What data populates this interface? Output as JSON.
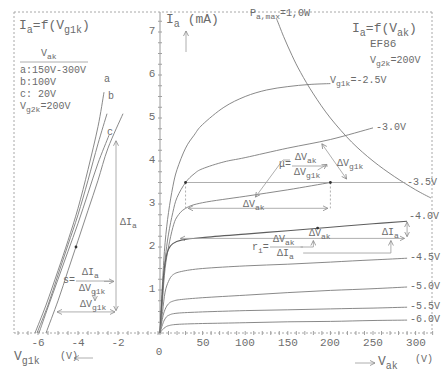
{
  "left_panel": {
    "title": {
      "i": "I",
      "i_sub": "a",
      "mid": "=f(V",
      "v_sub": "g1k",
      "end": ")"
    },
    "legend": {
      "header": {
        "main": "V",
        "sub": "ak"
      },
      "items": [
        "a:150V-300V",
        "b:100V",
        "c: 20V"
      ],
      "vg2k": {
        "main": "V",
        "sub": "g2k",
        "value": "=200V"
      }
    },
    "curve_labels": {
      "a": "a",
      "b": "b",
      "c": "c"
    },
    "delta_ia": {
      "main": "ΔI",
      "sub": "a"
    },
    "slope_formula": {
      "lhs": "s=",
      "num_main": "ΔI",
      "num_sub": "a",
      "den_main": "ΔV",
      "den_sub": "g1k"
    },
    "delta_vg1k": {
      "main": "ΔV",
      "sub": "g1k"
    },
    "x_ticks": [
      "-6",
      "-4",
      "-2"
    ],
    "x_axis_label": {
      "main": "V",
      "sub": "g1k",
      "unit": "(V)",
      "arrow": "←—"
    }
  },
  "main_panel": {
    "y_ticks": [
      "1",
      "2",
      "3",
      "4",
      "5",
      "6",
      "7"
    ],
    "y_axis_label": {
      "main": "I",
      "sub": "a",
      "unit": "(mA)",
      "arrow": "↑"
    },
    "power_label": {
      "main": "P",
      "sub": "a,max",
      "value": "=1,0W"
    },
    "title": {
      "i": "I",
      "i_sub": "a",
      "mid": "=f(V",
      "v_sub": "ak",
      "end": ")"
    },
    "tube": "EF86",
    "vg2k": {
      "main": "V",
      "sub": "g2k",
      "value": "=200V"
    },
    "curve_labels": {
      "first": {
        "main": "V",
        "sub": "g1k",
        "value": "=-2.5V"
      },
      "others": [
        "-3.0V",
        "-3.5V",
        "-4.0V",
        "-4.5V",
        "-5.0V",
        "-5.5V",
        "-6.0V"
      ]
    },
    "mu_formula": {
      "lhs": "μ=",
      "num_main": "ΔV",
      "num_sub": "ak",
      "den_main": "ΔV",
      "den_sub": "g1k"
    },
    "delta_vg1k": {
      "main": "ΔV",
      "sub": "g1k"
    },
    "delta_vak_mu": {
      "main": "ΔV",
      "sub": "ak"
    },
    "delta_vak_ri": {
      "main": "ΔV",
      "sub": "ak"
    },
    "delta_ia_ri": {
      "main": "ΔI",
      "sub": "a"
    },
    "ri_formula": {
      "lhs_main": "r",
      "lhs_sub": "i",
      "eq": "=",
      "num_main": "ΔV",
      "num_sub": "ak",
      "den_main": "ΔI",
      "den_sub": "a"
    },
    "x_ticks": [
      "50",
      "100",
      "150",
      "200",
      "250",
      "300"
    ],
    "origin": "0",
    "x_axis_label": {
      "arrow": "—→",
      "main": "V",
      "sub": "ak",
      "unit": "(V)"
    }
  },
  "colors": {
    "line": "#7c7c7c",
    "annotation": "#9a9a9a",
    "text": "#6b6b6b",
    "background": "#ffffff"
  },
  "chart_data": [
    {
      "type": "line",
      "title": "Ia=f(Vak)",
      "subtitle": "EF86, Vg2k=200V",
      "xlabel": "Vak (V)",
      "ylabel": "Ia (mA)",
      "xlim": [
        0,
        320
      ],
      "ylim": [
        0,
        7.5
      ],
      "xticks": [
        0,
        50,
        100,
        150,
        200,
        250,
        300
      ],
      "yticks": [
        1,
        2,
        3,
        4,
        5,
        6,
        7
      ],
      "grid": false,
      "legend": "inline labels at curve ends",
      "series": [
        {
          "name": "Vg1k=-2.5V",
          "points": [
            [
              0,
              0
            ],
            [
              3,
              1.2
            ],
            [
              6,
              2.1
            ],
            [
              10,
              2.8
            ],
            [
              15,
              3.4
            ],
            [
              20,
              3.8
            ],
            [
              30,
              4.3
            ],
            [
              40,
              4.6
            ],
            [
              50,
              4.85
            ],
            [
              75,
              5.25
            ],
            [
              100,
              5.5
            ],
            [
              125,
              5.65
            ],
            [
              150,
              5.73
            ],
            [
              175,
              5.78
            ],
            [
              200,
              5.8
            ]
          ]
        },
        {
          "name": "-3.0V",
          "points": [
            [
              0,
              0
            ],
            [
              3,
              0.9
            ],
            [
              6,
              1.7
            ],
            [
              10,
              2.3
            ],
            [
              15,
              2.8
            ],
            [
              20,
              3.15
            ],
            [
              30,
              3.5
            ],
            [
              40,
              3.7
            ],
            [
              50,
              3.82
            ],
            [
              75,
              3.98
            ],
            [
              100,
              4.08
            ],
            [
              150,
              4.3
            ],
            [
              200,
              4.5
            ],
            [
              250,
              4.77
            ]
          ]
        },
        {
          "name": "-3.5V",
          "points": [
            [
              0,
              0
            ],
            [
              3,
              0.8
            ],
            [
              6,
              1.5
            ],
            [
              10,
              2.0
            ],
            [
              15,
              2.45
            ],
            [
              20,
              2.7
            ],
            [
              30,
              2.9
            ],
            [
              50,
              3.03
            ],
            [
              100,
              3.18
            ],
            [
              150,
              3.33
            ],
            [
              200,
              3.5
            ]
          ]
        },
        {
          "name": "-4.0V",
          "points": [
            [
              0,
              0
            ],
            [
              2,
              0.7
            ],
            [
              4,
              1.3
            ],
            [
              7,
              1.75
            ],
            [
              10,
              1.95
            ],
            [
              15,
              2.08
            ],
            [
              25,
              2.16
            ],
            [
              50,
              2.22
            ],
            [
              100,
              2.3
            ],
            [
              150,
              2.38
            ],
            [
              200,
              2.46
            ],
            [
              250,
              2.54
            ],
            [
              290,
              2.6
            ]
          ]
        },
        {
          "name": "-4.5V",
          "points": [
            [
              0,
              0
            ],
            [
              3,
              0.5
            ],
            [
              6,
              0.95
            ],
            [
              10,
              1.2
            ],
            [
              15,
              1.35
            ],
            [
              25,
              1.43
            ],
            [
              50,
              1.5
            ],
            [
              100,
              1.56
            ],
            [
              150,
              1.6
            ],
            [
              200,
              1.65
            ],
            [
              250,
              1.7
            ],
            [
              290,
              1.74
            ]
          ]
        },
        {
          "name": "-5.0V",
          "points": [
            [
              0,
              0
            ],
            [
              3,
              0.35
            ],
            [
              6,
              0.55
            ],
            [
              10,
              0.68
            ],
            [
              15,
              0.74
            ],
            [
              25,
              0.78
            ],
            [
              50,
              0.82
            ],
            [
              100,
              0.88
            ],
            [
              150,
              0.94
            ],
            [
              200,
              0.99
            ],
            [
              250,
              1.03
            ],
            [
              290,
              1.07
            ]
          ]
        },
        {
          "name": "-5.5V",
          "points": [
            [
              0,
              0
            ],
            [
              3,
              0.2
            ],
            [
              6,
              0.33
            ],
            [
              10,
              0.41
            ],
            [
              20,
              0.46
            ],
            [
              50,
              0.49
            ],
            [
              100,
              0.52
            ],
            [
              150,
              0.54
            ],
            [
              200,
              0.56
            ],
            [
              250,
              0.58
            ],
            [
              290,
              0.6
            ]
          ]
        },
        {
          "name": "-6.0V",
          "points": [
            [
              0,
              0
            ],
            [
              3,
              0.08
            ],
            [
              6,
              0.13
            ],
            [
              10,
              0.17
            ],
            [
              20,
              0.2
            ],
            [
              50,
              0.22
            ],
            [
              100,
              0.24
            ],
            [
              150,
              0.26
            ],
            [
              200,
              0.27
            ],
            [
              250,
              0.29
            ],
            [
              290,
              0.3
            ]
          ]
        }
      ],
      "power_limit": {
        "name": "Pa,max=1,0W",
        "points": [
          [
            137,
            7.3
          ],
          [
            145,
            6.9
          ],
          [
            155,
            6.45
          ],
          [
            165,
            6.06
          ],
          [
            180,
            5.56
          ],
          [
            200,
            5.0
          ],
          [
            225,
            4.44
          ],
          [
            250,
            4.0
          ],
          [
            275,
            3.64
          ],
          [
            300,
            3.33
          ],
          [
            318,
            3.14
          ]
        ]
      },
      "annotations": [
        {
          "kind": "line",
          "from": [
            30,
            3.5
          ],
          "to": [
            288,
            3.5
          ]
        },
        {
          "kind": "dashed",
          "from": [
            30,
            3.5
          ],
          "to": [
            30,
            2.9
          ]
        },
        {
          "kind": "dashed",
          "from": [
            200,
            3.5
          ],
          "to": [
            200,
            2.9
          ]
        },
        {
          "kind": "darrow",
          "from": [
            33,
            2.9
          ],
          "to": [
            197,
            2.9
          ]
        },
        {
          "kind": "darrow",
          "from": [
            190,
            4.4
          ],
          "to": [
            219,
            3.58
          ]
        },
        {
          "kind": "arrow",
          "from": [
            144,
            4.02
          ],
          "to": [
            112,
            3.16
          ]
        },
        {
          "kind": "arrow",
          "from": [
            185,
            3.79
          ],
          "to": [
            196,
            3.92
          ]
        },
        {
          "kind": "darrow",
          "from": [
            24,
            2.2
          ],
          "to": [
            287,
            2.2
          ]
        },
        {
          "kind": "darrow",
          "from": [
            290,
            2.58
          ],
          "to": [
            290,
            2.24
          ]
        },
        {
          "kind": "polyarrow",
          "points": [
            [
              165,
              2.0
            ],
            [
              180,
              2.0
            ],
            [
              180,
              2.15
            ]
          ]
        },
        {
          "kind": "polyarrow",
          "points": [
            [
              168,
              1.86
            ],
            [
              271,
              1.86
            ],
            [
              271,
              2.15
            ]
          ]
        },
        {
          "kind": "dot",
          "at": [
            30,
            3.5
          ]
        },
        {
          "kind": "dot",
          "at": [
            200,
            3.5
          ]
        },
        {
          "kind": "dot",
          "at": [
            185,
            2.44
          ]
        }
      ]
    },
    {
      "type": "line",
      "title": "Ia=f(Vg1k)",
      "subtitle": "Vg2k=200V; a:150V-300V, b:100V, c:20V",
      "xlabel": "Vg1k (V)",
      "ylabel": "Ia (mA)",
      "xlim": [
        -7,
        0
      ],
      "ylim": [
        0,
        7.5
      ],
      "xticks": [
        -6,
        -4,
        -2
      ],
      "grid": false,
      "series": [
        {
          "name": "a (300V)",
          "points": [
            [
              -6.15,
              0
            ],
            [
              -5.6,
              0.65
            ],
            [
              -5,
              1.45
            ],
            [
              -4.5,
              2.15
            ],
            [
              -4,
              2.9
            ],
            [
              -3.5,
              3.8
            ],
            [
              -3,
              4.8
            ],
            [
              -2.7,
              5.6
            ]
          ]
        },
        {
          "name": "a (150V)",
          "points": [
            [
              -6.05,
              0
            ],
            [
              -5.5,
              0.65
            ],
            [
              -5,
              1.35
            ],
            [
              -4.5,
              2.05
            ],
            [
              -4,
              2.75
            ],
            [
              -3.5,
              3.55
            ],
            [
              -3,
              4.4
            ],
            [
              -2.55,
              5.1
            ]
          ]
        },
        {
          "name": "b (100V)",
          "points": [
            [
              -5.95,
              0
            ],
            [
              -5.5,
              0.6
            ],
            [
              -5,
              1.25
            ],
            [
              -4.5,
              1.9
            ],
            [
              -4,
              2.55
            ],
            [
              -3.5,
              3.25
            ],
            [
              -3,
              3.95
            ],
            [
              -2.45,
              4.6
            ]
          ]
        },
        {
          "name": "c (20V)",
          "points": [
            [
              -5.6,
              0
            ],
            [
              -5,
              0.75
            ],
            [
              -4.5,
              1.45
            ],
            [
              -4,
              2.15
            ],
            [
              -3.5,
              2.85
            ],
            [
              -3,
              3.55
            ],
            [
              -2.5,
              4.3
            ],
            [
              -1.75,
              5.1
            ]
          ]
        }
      ],
      "annotations": [
        {
          "kind": "darrow",
          "from": [
            -2.1,
            0.52
          ],
          "to": [
            -2.1,
            4.47
          ]
        },
        {
          "kind": "darrow",
          "from": [
            -5.05,
            0.49
          ],
          "to": [
            -2.15,
            0.49
          ]
        },
        {
          "kind": "arrow",
          "from": [
            -2.7,
            1.2
          ],
          "to": [
            -2.2,
            1.2
          ]
        },
        {
          "kind": "arrow",
          "from": [
            -3.15,
            0.98
          ],
          "to": [
            -3.15,
            0.75
          ]
        },
        {
          "kind": "dot",
          "at": [
            -4.1,
            2.0
          ]
        }
      ]
    }
  ]
}
